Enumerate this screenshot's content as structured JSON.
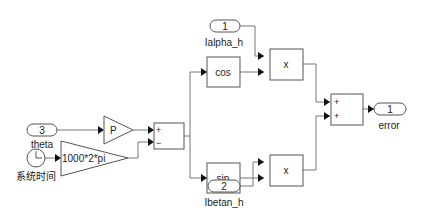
{
  "diagram": {
    "inports": [
      {
        "number": "3",
        "name": "theta"
      },
      {
        "number": "1",
        "name": "Ialpha_h"
      },
      {
        "number": "2",
        "name": "Ibetan_h"
      }
    ],
    "clock": {
      "name": "系统时间"
    },
    "gains": [
      {
        "label": "P"
      },
      {
        "label": "1000*2*pi"
      }
    ],
    "sum1": {
      "signs": [
        "+",
        "−"
      ]
    },
    "trig": [
      {
        "label": "cos"
      },
      {
        "label": "sin"
      }
    ],
    "products": [
      {
        "label": "x"
      },
      {
        "label": "x"
      }
    ],
    "sum2": {
      "signs": [
        "+",
        "+"
      ]
    },
    "outport": {
      "number": "1",
      "name": "error"
    }
  }
}
